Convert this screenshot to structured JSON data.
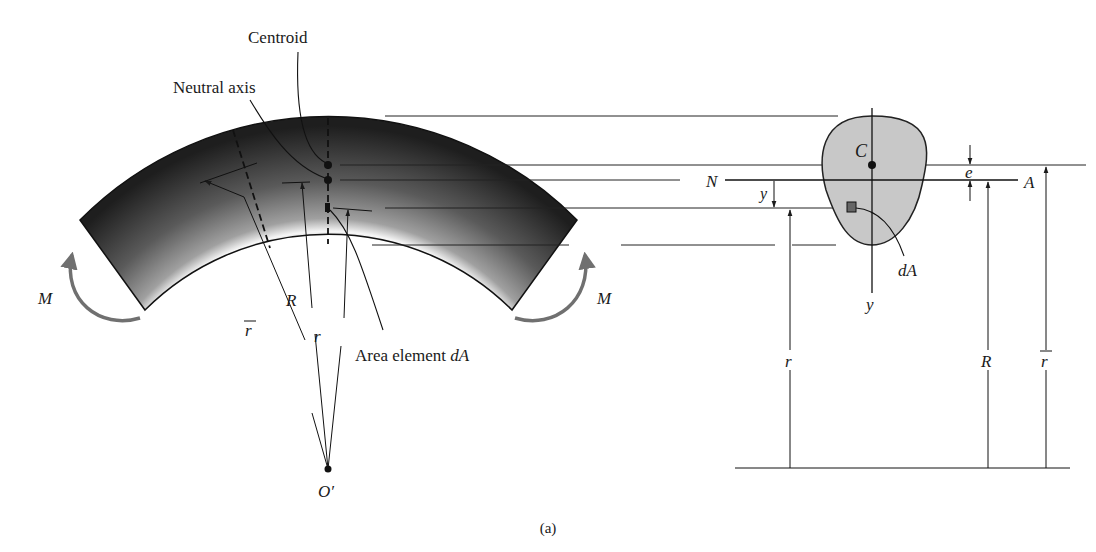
{
  "figure": {
    "caption": "(a)",
    "colors": {
      "ink": "#1a1a1a",
      "moment_arrow": "#707070",
      "section_fill": "#c8c8c8",
      "beam_dark": "#1e1e1e",
      "beam_light": "#f4f4f4"
    }
  },
  "beam_view": {
    "labels": {
      "centroid": "Centroid",
      "neutral_axis": "Neutral axis",
      "area_element": "Area element ",
      "area_element_symbol": "dA",
      "moment_left": "M",
      "moment_right": "M",
      "r_bar": "r",
      "R": "R",
      "r": "r",
      "center": "O′"
    }
  },
  "section_view": {
    "labels": {
      "C": "C",
      "N": "N",
      "A": "A",
      "e": "e",
      "y_offset": "y",
      "y_axis": "y",
      "dA": "dA",
      "r": "r",
      "R": "R",
      "r_bar": "r"
    }
  }
}
